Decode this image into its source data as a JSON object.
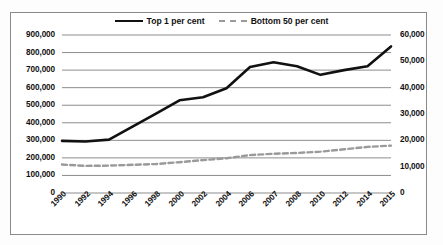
{
  "chart_data": {
    "type": "line",
    "title": "",
    "subtitle": "",
    "xlabel": "",
    "ylabel": "",
    "categories": [
      "1990",
      "1992",
      "1994",
      "1996",
      "1998",
      "2000",
      "2002",
      "2004",
      "2006",
      "2007",
      "2008",
      "2010",
      "2012",
      "2014",
      "2015"
    ],
    "grid": true,
    "legend_position": "top-center",
    "axes": {
      "left": {
        "label": "",
        "ylim": [
          0,
          900000
        ],
        "ticks": [
          0,
          100000,
          200000,
          300000,
          400000,
          500000,
          600000,
          700000,
          800000,
          900000
        ],
        "tick_labels": [
          "0",
          "100,000",
          "200,000",
          "300,000",
          "400,000",
          "500,000",
          "600,000",
          "700,000",
          "800,000",
          "900,000"
        ]
      },
      "right": {
        "label": "",
        "ylim": [
          0,
          60000
        ],
        "ticks": [
          0,
          10000,
          20000,
          30000,
          40000,
          50000,
          60000
        ],
        "tick_labels": [
          "0",
          "10,000",
          "20,000",
          "30,000",
          "40,000",
          "50,000",
          "60,000"
        ]
      }
    },
    "series": [
      {
        "name": "Top 1 per cent",
        "axis": "left",
        "style": "solid",
        "color": "#111111",
        "values": [
          297000,
          293000,
          304000,
          378000,
          452000,
          528000,
          545000,
          597000,
          718000,
          745000,
          722000,
          673000,
          700000,
          722000,
          835000
        ]
      },
      {
        "name": "Bottom 50 per cent",
        "axis": "right",
        "style": "dashed",
        "color": "#9a9a9a",
        "values": [
          10800,
          10300,
          10400,
          10700,
          11000,
          11700,
          12500,
          13200,
          14400,
          14900,
          15200,
          15700,
          16600,
          17500,
          18000
        ]
      }
    ]
  },
  "legend": {
    "items": [
      {
        "label": "Top 1 per cent",
        "style": "solid"
      },
      {
        "label": "Bottom 50 per cent",
        "style": "dashed"
      }
    ]
  }
}
